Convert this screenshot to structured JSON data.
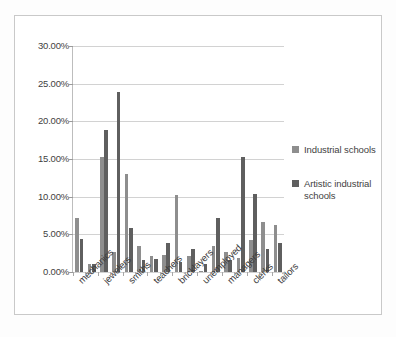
{
  "chart_data": {
    "type": "bar",
    "title": "",
    "subtitle": "",
    "xlabel": "",
    "ylabel": "",
    "ylim": [
      0,
      30
    ],
    "ytick_labels": [
      "0.00%",
      "5.00%",
      "10.00%",
      "15.00%",
      "20.00%",
      "25.00%",
      "30.00%"
    ],
    "ytick_values": [
      0,
      5,
      10,
      15,
      20,
      25,
      30
    ],
    "grid": true,
    "legend_position": "right",
    "categories": [
      "mechanics",
      "",
      "jewelers",
      "",
      "smiths",
      "",
      "teachers",
      "",
      "bricklayers",
      "",
      "unemployed",
      "",
      "managers",
      "",
      "clerks",
      "",
      "tailors"
    ],
    "visible_tick_labels": [
      "mechanics",
      "jewelers",
      "smiths",
      "teachers",
      "bricklayers",
      "unemployed",
      "managers",
      "clerks",
      "tailors"
    ],
    "series": [
      {
        "name": "Industrial schools",
        "color": "#8e8e8e",
        "values": [
          7.2,
          1.0,
          15.3,
          2.6,
          2.6,
          13.0,
          3.5,
          1.6,
          1.7,
          10.2,
          1.3,
          0.2,
          3.5,
          7.2,
          1.6,
          15.3,
          10.4
        ]
      },
      {
        "name": "Artistic industrial schools",
        "color": "#5f5f5f",
        "values": [
          4.4,
          1.1,
          18.9,
          0.0,
          23.9,
          5.8,
          2.1,
          2.3,
          3.9,
          0.0,
          3.1,
          1.0,
          0.0,
          2.6,
          1.8,
          4.2,
          3.2
        ]
      }
    ],
    "extra_pairs": [
      {
        "category": "mechanics",
        "industrial": 7.2,
        "artistic": 4.4
      },
      {
        "category": "jewelers",
        "industrial": 15.3,
        "artistic": 18.9
      },
      {
        "category": "smiths",
        "industrial": 2.6,
        "artistic": 23.9
      },
      {
        "category": "teachers",
        "industrial": 13.0,
        "artistic": 5.8
      },
      {
        "category": "bricklayers",
        "industrial": 1.7,
        "artistic": 3.9
      },
      {
        "category": "unemployed",
        "industrial": 10.2,
        "artistic": 3.1
      },
      {
        "category": "managers",
        "industrial": 3.5,
        "artistic": 2.6
      },
      {
        "category": "clerks",
        "industrial": 15.3,
        "artistic": 4.2
      },
      {
        "category": "tailors",
        "industrial": 10.4,
        "artistic": 3.2
      }
    ],
    "bars": [
      {
        "group": 1,
        "series": "Industrial schools",
        "value": 7.2
      },
      {
        "group": 1,
        "series": "Artistic industrial schools",
        "value": 4.4
      },
      {
        "group": 2,
        "series": "Industrial schools",
        "value": 1.0
      },
      {
        "group": 2,
        "series": "Artistic industrial schools",
        "value": 1.1
      },
      {
        "group": 3,
        "series": "Industrial schools",
        "value": 15.3
      },
      {
        "group": 3,
        "series": "Artistic industrial schools",
        "value": 18.9
      },
      {
        "group": 4,
        "series": "Industrial schools",
        "value": 2.6
      },
      {
        "group": 4,
        "series": "Artistic industrial schools",
        "value": 23.9
      },
      {
        "group": 5,
        "series": "Industrial schools",
        "value": 13.0
      },
      {
        "group": 5,
        "series": "Artistic industrial schools",
        "value": 5.8
      },
      {
        "group": 6,
        "series": "Industrial schools",
        "value": 3.5
      },
      {
        "group": 6,
        "series": "Artistic industrial schools",
        "value": 1.6
      },
      {
        "group": 7,
        "series": "Industrial schools",
        "value": 2.1
      },
      {
        "group": 7,
        "series": "Artistic industrial schools",
        "value": 1.7
      },
      {
        "group": 8,
        "series": "Industrial schools",
        "value": 2.3
      },
      {
        "group": 8,
        "series": "Artistic industrial schools",
        "value": 3.9
      },
      {
        "group": 9,
        "series": "Industrial schools",
        "value": 10.2
      },
      {
        "group": 9,
        "series": "Artistic industrial schools",
        "value": 1.3
      },
      {
        "group": 10,
        "series": "Industrial schools",
        "value": 2.1
      },
      {
        "group": 10,
        "series": "Artistic industrial schools",
        "value": 3.1
      },
      {
        "group": 11,
        "series": "Industrial schools",
        "value": 0.2
      },
      {
        "group": 11,
        "series": "Artistic industrial schools",
        "value": 1.0
      },
      {
        "group": 12,
        "series": "Industrial schools",
        "value": 3.5
      },
      {
        "group": 12,
        "series": "Artistic industrial schools",
        "value": 7.2
      },
      {
        "group": 13,
        "series": "Industrial schools",
        "value": 2.6
      },
      {
        "group": 13,
        "series": "Artistic industrial schools",
        "value": 1.6
      },
      {
        "group": 14,
        "series": "Industrial schools",
        "value": 1.8
      },
      {
        "group": 14,
        "series": "Artistic industrial schools",
        "value": 15.3
      },
      {
        "group": 15,
        "series": "Industrial schools",
        "value": 4.2
      },
      {
        "group": 15,
        "series": "Artistic industrial schools",
        "value": 10.4
      },
      {
        "group": 16,
        "series": "Industrial schools",
        "value": 6.7
      },
      {
        "group": 16,
        "series": "Artistic industrial schools",
        "value": 3.1
      },
      {
        "group": 17,
        "series": "Industrial schools",
        "value": 6.3
      },
      {
        "group": 17,
        "series": "Artistic industrial schools",
        "value": 3.8
      }
    ]
  },
  "legend": {
    "entries": [
      {
        "label": "Industrial schools",
        "color": "#8e8e8e"
      },
      {
        "label": "Artistic industrial schools",
        "color": "#5f5f5f"
      }
    ]
  }
}
